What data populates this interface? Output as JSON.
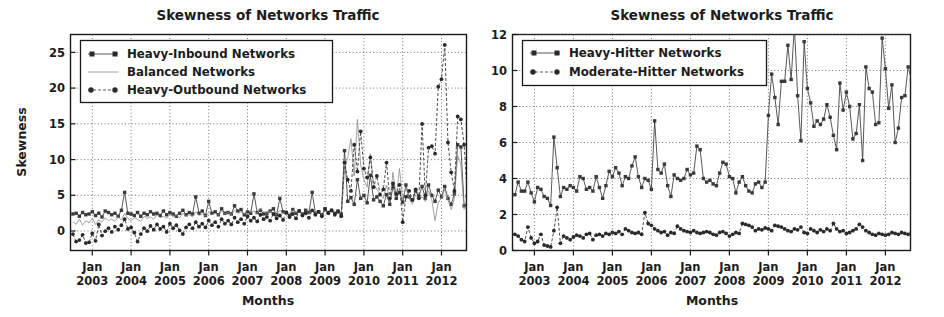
{
  "figure": {
    "background": "#ffffff",
    "ink": "#1a1a1a"
  },
  "panels": [
    {
      "name": "left-panel",
      "title": "Skewness of Networks Traffic",
      "xlabel": "Months",
      "ylabel": "Skewness"
    },
    {
      "name": "right-panel",
      "title": "Skewness of Networks Traffic",
      "xlabel": "Months",
      "ylabel": ""
    }
  ],
  "chart_data": [
    {
      "type": "line",
      "title": "Skewness of Networks Traffic",
      "xlabel": "Months",
      "ylabel": "Skewness",
      "ylim": [
        -2,
        27
      ],
      "yticks": [
        0,
        5,
        10,
        15,
        20,
        25
      ],
      "xticks": [
        "Jan\n2003",
        "Jan\n2004",
        "Jan\n2005",
        "Jan\n2006",
        "Jan\n2007",
        "Jan\n2008",
        "Jan\n2009",
        "Jan\n2010",
        "Jan\n2011",
        "Jan\n2012"
      ],
      "xtick_labels_line1": [
        "Jan",
        "Jan",
        "Jan",
        "Jan",
        "Jan",
        "Jan",
        "Jan",
        "Jan",
        "Jan",
        "Jan"
      ],
      "xtick_labels_line2": [
        "2003",
        "2004",
        "2005",
        "2006",
        "2007",
        "2008",
        "2009",
        "2010",
        "2011",
        "2012"
      ],
      "grid": true,
      "legend_position": "upper left",
      "legend": [
        "Heavy-Inbound Networks",
        "Balanced Networks",
        "Heavy-Outbound Networks"
      ],
      "x_start": "2002-07",
      "x_end": "2012-06",
      "series": [
        {
          "name": "Heavy-Inbound Networks",
          "marker": "square",
          "linestyle": "solid",
          "color": "#3a3a3a",
          "values": [
            2.9,
            3.0,
            2.6,
            3.1,
            2.8,
            2.9,
            3.2,
            2.7,
            3.0,
            2.5,
            3.3,
            3.1,
            2.8,
            3.0,
            2.6,
            3.4,
            5.8,
            3.0,
            2.9,
            2.7,
            3.1,
            2.6,
            3.0,
            2.8,
            3.2,
            2.9,
            3.0,
            2.7,
            3.3,
            2.8,
            3.1,
            2.9,
            2.6,
            3.0,
            3.4,
            2.8,
            3.1,
            2.9,
            5.2,
            3.0,
            3.3,
            2.7,
            4.6,
            3.0,
            3.2,
            2.8,
            3.6,
            3.0,
            3.1,
            2.9,
            4.0,
            3.3,
            3.5,
            2.8,
            3.2,
            3.0,
            5.6,
            3.1,
            3.4,
            2.9,
            3.0,
            3.3,
            3.6,
            2.8,
            5.0,
            3.2,
            3.1,
            2.7,
            3.5,
            3.0,
            3.3,
            2.9,
            3.4,
            3.1,
            5.8,
            3.0,
            3.2,
            2.8,
            3.6,
            3.1,
            3.4,
            3.0,
            3.3,
            2.9,
            11.4,
            4.6,
            5.1,
            4.2,
            7.5,
            5.0,
            5.4,
            4.4,
            8.1,
            4.8,
            5.2,
            4.6,
            4.0,
            5.5,
            4.2,
            6.6,
            5.0,
            5.8,
            4.5,
            6.8,
            5.2,
            4.8,
            6.0,
            5.3,
            6.6,
            5.0,
            6.8,
            5.4,
            4.6,
            6.1,
            5.2,
            6.6,
            5.0,
            4.2,
            5.6,
            12.2,
            11.9,
            4.0,
            4.3,
            5.0,
            4.6,
            3.8,
            15.8,
            12.2,
            4.4,
            4.8,
            4.2,
            3.9
          ]
        },
        {
          "name": "Balanced Networks",
          "marker": "none",
          "linestyle": "solid",
          "color": "#8a8a8a",
          "values": [
            1.9,
            1.5,
            2.2,
            1.4,
            2.0,
            1.7,
            2.3,
            1.5,
            2.1,
            1.8,
            2.4,
            2.0,
            2.2,
            1.9,
            2.5,
            2.1,
            3.0,
            2.3,
            2.0,
            2.4,
            2.2,
            1.9,
            2.6,
            2.3,
            2.5,
            2.2,
            2.8,
            2.4,
            2.6,
            2.3,
            2.9,
            2.5,
            2.7,
            2.4,
            3.0,
            2.6,
            2.8,
            2.5,
            3.2,
            2.7,
            2.9,
            2.6,
            3.1,
            2.8,
            3.0,
            2.7,
            3.3,
            2.9,
            3.1,
            2.8,
            3.4,
            3.0,
            3.2,
            2.9,
            3.5,
            3.1,
            3.3,
            3.0,
            3.6,
            3.2,
            3.0,
            3.3,
            3.1,
            2.8,
            3.4,
            3.0,
            3.2,
            2.9,
            3.5,
            3.1,
            3.3,
            3.0,
            3.2,
            2.9,
            3.4,
            3.1,
            3.0,
            2.8,
            3.3,
            3.0,
            3.2,
            2.9,
            3.1,
            3.0,
            8.8,
            10.5,
            13.0,
            8.0,
            15.6,
            9.5,
            7.5,
            6.5,
            11.0,
            7.0,
            6.2,
            5.5,
            5.0,
            6.8,
            4.5,
            8.5,
            5.2,
            9.0,
            4.8,
            6.5,
            5.0,
            4.2,
            5.5,
            4.8,
            5.2,
            4.6,
            6.0,
            4.8,
            2.0,
            4.5,
            5.0,
            6.2,
            4.8,
            3.5,
            5.0,
            10.8,
            9.5,
            3.5,
            4.0,
            4.8,
            4.2,
            3.6,
            15.2,
            14.8,
            4.2,
            4.6,
            4.0,
            3.8
          ]
        },
        {
          "name": "Heavy-Outbound Networks",
          "marker": "circle",
          "linestyle": "dashed",
          "color": "#2a2a2a",
          "values": [
            0.2,
            -0.8,
            -0.6,
            0.1,
            -1.0,
            -0.9,
            0.3,
            -0.7,
            1.5,
            0.0,
            0.6,
            1.0,
            0.5,
            1.2,
            0.8,
            1.4,
            2.2,
            0.9,
            1.1,
            0.4,
            -0.8,
            0.2,
            1.0,
            0.6,
            1.3,
            0.8,
            1.5,
            0.9,
            1.2,
            0.5,
            1.6,
            1.0,
            1.4,
            0.7,
            0.2,
            1.1,
            1.5,
            1.0,
            1.8,
            1.2,
            1.6,
            1.1,
            2.0,
            1.4,
            1.8,
            1.2,
            2.2,
            1.6,
            2.0,
            1.5,
            2.4,
            1.8,
            2.2,
            1.6,
            2.6,
            2.0,
            2.4,
            1.9,
            2.8,
            2.2,
            2.5,
            2.0,
            2.9,
            2.3,
            2.7,
            2.1,
            3.1,
            2.5,
            2.9,
            2.3,
            3.3,
            2.7,
            3.0,
            2.4,
            3.4,
            2.8,
            3.2,
            2.6,
            3.6,
            3.0,
            3.4,
            2.8,
            3.2,
            2.6,
            9.8,
            7.5,
            6.0,
            12.2,
            8.6,
            14.0,
            9.0,
            7.8,
            10.5,
            6.5,
            8.0,
            5.5,
            6.2,
            9.8,
            5.0,
            7.0,
            5.6,
            6.8,
            1.8,
            5.2,
            6.0,
            4.8,
            6.2,
            5.0,
            15.0,
            5.4,
            11.8,
            12.0,
            11.0,
            20.0,
            21.0,
            25.6,
            12.5,
            8.5,
            6.0,
            16.0,
            15.6,
            12.2,
            5.2,
            4.6,
            5.0,
            4.2,
            11.0,
            6.5,
            4.8,
            5.2,
            4.4,
            4.0
          ]
        }
      ]
    },
    {
      "type": "line",
      "title": "Skewness of Networks Traffic",
      "xlabel": "Months",
      "ylabel": "",
      "ylim": [
        0,
        12
      ],
      "yticks": [
        0,
        2,
        4,
        6,
        8,
        10,
        12
      ],
      "xticks": [
        "Jan\n2003",
        "Jan\n2004",
        "Jan\n2005",
        "Jan\n2006",
        "Jan\n2007",
        "Jan\n2008",
        "Jan\n2009",
        "Jan\n2010",
        "Jan\n2011",
        "Jan\n2012"
      ],
      "xtick_labels_line1": [
        "Jan",
        "Jan",
        "Jan",
        "Jan",
        "Jan",
        "Jan",
        "Jan",
        "Jan",
        "Jan",
        "Jan"
      ],
      "xtick_labels_line2": [
        "2003",
        "2004",
        "2005",
        "2006",
        "2007",
        "2008",
        "2009",
        "2010",
        "2011",
        "2012"
      ],
      "grid": true,
      "legend_position": "upper left",
      "legend": [
        "Heavy-Hitter Networks",
        "Moderate-Hitter Networks"
      ],
      "x_start": "2002-07",
      "x_end": "2012-06",
      "series": [
        {
          "name": "Heavy-Hitter Networks",
          "marker": "square",
          "linestyle": "solid",
          "color": "#3a3a3a",
          "values": [
            3.1,
            3.8,
            3.3,
            3.3,
            3.8,
            3.2,
            2.7,
            3.5,
            3.4,
            3.0,
            2.9,
            2.5,
            6.3,
            4.6,
            3.0,
            3.5,
            3.4,
            3.6,
            3.5,
            3.3,
            4.1,
            4.0,
            3.4,
            3.5,
            3.3,
            4.1,
            3.5,
            2.9,
            3.6,
            4.4,
            4.1,
            4.6,
            4.3,
            3.6,
            4.1,
            4.0,
            4.7,
            5.2,
            4.1,
            3.5,
            4.0,
            3.9,
            3.4,
            7.2,
            4.5,
            4.3,
            4.8,
            3.6,
            3.0,
            4.2,
            4.0,
            3.9,
            4.0,
            4.5,
            4.2,
            4.3,
            5.8,
            5.6,
            4.0,
            3.8,
            3.9,
            3.7,
            3.6,
            4.3,
            4.9,
            4.8,
            4.1,
            4.0,
            3.2,
            3.8,
            4.1,
            3.6,
            3.3,
            3.2,
            3.7,
            3.8,
            3.5,
            3.8,
            7.5,
            9.8,
            8.5,
            7.0,
            9.4,
            9.4,
            11.4,
            9.5,
            12.5,
            8.6,
            6.1,
            11.6,
            9.0,
            8.2,
            6.9,
            7.2,
            7.0,
            7.3,
            8.1,
            7.4,
            6.4,
            5.6,
            9.3,
            7.8,
            8.8,
            8.0,
            6.2,
            6.5,
            8.1,
            5.0,
            10.2,
            9.0,
            8.8,
            7.0,
            7.1,
            11.8,
            10.1,
            7.9,
            9.2,
            6.0,
            6.8,
            8.5,
            8.6,
            10.2,
            9.5,
            8.0,
            6.6,
            7.9,
            7.6,
            7.2,
            7.5,
            7.8,
            7.4,
            7.6
          ]
        },
        {
          "name": "Moderate-Hitter Networks",
          "marker": "circle",
          "linestyle": "dashed",
          "color": "#2a2a2a",
          "values": [
            0.9,
            0.8,
            0.6,
            0.5,
            1.3,
            0.7,
            0.4,
            0.5,
            0.9,
            0.3,
            0.25,
            0.2,
            1.1,
            2.4,
            0.4,
            0.8,
            0.7,
            0.6,
            0.75,
            0.85,
            0.8,
            0.7,
            0.9,
            0.95,
            0.6,
            0.85,
            0.9,
            0.8,
            0.95,
            0.9,
            1.0,
            0.95,
            1.05,
            0.9,
            1.2,
            1.1,
            1.0,
            0.95,
            1.0,
            0.9,
            2.1,
            1.5,
            1.4,
            1.2,
            1.1,
            1.0,
            1.05,
            0.85,
            1.0,
            0.95,
            1.35,
            1.2,
            1.1,
            1.05,
            1.0,
            1.1,
            1.0,
            0.95,
            1.0,
            1.05,
            1.0,
            0.9,
            0.85,
            1.0,
            1.05,
            0.95,
            0.8,
            0.9,
            1.0,
            0.95,
            1.5,
            1.45,
            1.4,
            1.3,
            1.1,
            1.2,
            1.15,
            1.25,
            1.2,
            1.1,
            1.4,
            1.35,
            1.3,
            1.2,
            1.1,
            1.05,
            1.2,
            1.15,
            1.3,
            1.0,
            0.95,
            1.2,
            1.1,
            1.0,
            1.15,
            1.05,
            1.2,
            1.1,
            1.5,
            1.2,
            1.05,
            1.1,
            0.95,
            1.0,
            1.1,
            1.2,
            1.45,
            1.3,
            1.1,
            1.0,
            0.9,
            0.85,
            0.95,
            0.9,
            0.85,
            0.9,
            1.0,
            0.95,
            0.9,
            1.0,
            0.95,
            0.9,
            1.0,
            0.95,
            0.85,
            0.9,
            1.0,
            0.95,
            0.9,
            0.8,
            0.5,
            0.9
          ]
        }
      ]
    }
  ]
}
